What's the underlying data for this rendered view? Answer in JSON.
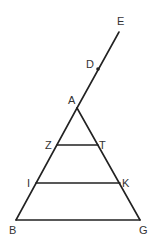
{
  "diagram": {
    "type": "geometry-figure",
    "points": {
      "E": {
        "label": "E",
        "x": 119,
        "y": 32,
        "lx": 117,
        "ly": 25
      },
      "D": {
        "label": "D",
        "x": 98,
        "y": 69,
        "lx": 86,
        "ly": 68
      },
      "A": {
        "label": "A",
        "x": 77,
        "y": 108,
        "lx": 68,
        "ly": 104
      },
      "Z": {
        "label": "Z",
        "x": 57,
        "y": 145,
        "lx": 45,
        "ly": 149
      },
      "T": {
        "label": "T",
        "x": 98,
        "y": 145,
        "lx": 99,
        "ly": 149
      },
      "I": {
        "label": "I",
        "x": 36,
        "y": 183,
        "lx": 27,
        "ly": 187
      },
      "K": {
        "label": "K",
        "x": 120,
        "y": 183,
        "lx": 122,
        "ly": 187
      },
      "B": {
        "label": "B",
        "x": 16,
        "y": 220,
        "lx": 9,
        "ly": 234
      },
      "G": {
        "label": "G",
        "x": 140,
        "y": 220,
        "lx": 139,
        "ly": 234
      }
    },
    "segments": [
      {
        "from": "E",
        "to": "A",
        "name": "line-EA"
      },
      {
        "from": "A",
        "to": "B",
        "name": "side-AB"
      },
      {
        "from": "A",
        "to": "G",
        "name": "side-AG"
      },
      {
        "from": "B",
        "to": "G",
        "name": "base-BG"
      },
      {
        "from": "Z",
        "to": "T",
        "name": "segment-ZT"
      },
      {
        "from": "I",
        "to": "K",
        "name": "segment-IK"
      }
    ],
    "marked_points": [
      "D"
    ],
    "line_color": "#222222",
    "label_color": "#333333"
  },
  "labels": {
    "E": "E",
    "D": "D",
    "A": "A",
    "Z": "Z",
    "T": "T",
    "I": "I",
    "K": "K",
    "B": "B",
    "G": "G"
  }
}
